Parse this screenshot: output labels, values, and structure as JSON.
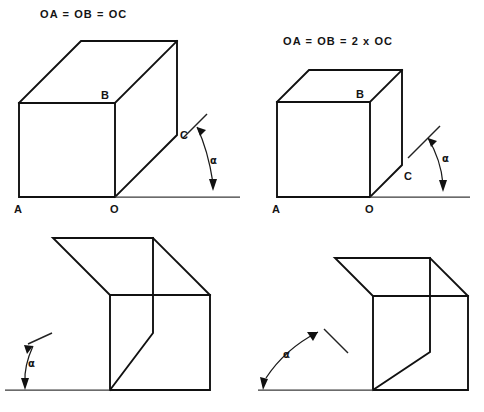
{
  "document": {
    "title": "Oblique projection receding-axis angle figures",
    "background_color": "#ffffff",
    "ink_color": "#111111",
    "width": 484,
    "height": 412
  },
  "figures": [
    {
      "id": "figure-top-left",
      "caption": "OA = OB = OC",
      "angle_label": "α",
      "vertex_labels": {
        "a": "A",
        "o": "O",
        "b": "B",
        "c": "C"
      },
      "projection": "cavalier",
      "depth_ratio": "1",
      "recede_direction": "up-right",
      "angle_degrees": 45
    },
    {
      "id": "figure-top-right",
      "caption": "OA = OB = 2 x OC",
      "angle_label": "α",
      "vertex_labels": {
        "a": "A",
        "o": "O",
        "b": "B",
        "c": "C"
      },
      "projection": "cabinet",
      "depth_ratio": "0.5",
      "recede_direction": "up-right",
      "angle_degrees": 45
    },
    {
      "id": "figure-bottom-left",
      "caption": "",
      "angle_label": "α",
      "vertex_labels": {
        "a": "",
        "o": "",
        "b": "",
        "c": ""
      },
      "projection": "cavalier",
      "depth_ratio": "1",
      "recede_direction": "up-left",
      "angle_degrees": 60
    },
    {
      "id": "figure-bottom-right",
      "caption": "",
      "angle_label": "α",
      "vertex_labels": {
        "a": "",
        "o": "",
        "b": "",
        "c": ""
      },
      "projection": "cavalier",
      "depth_ratio": "0.55",
      "recede_direction": "up-left",
      "angle_degrees": 62
    }
  ]
}
